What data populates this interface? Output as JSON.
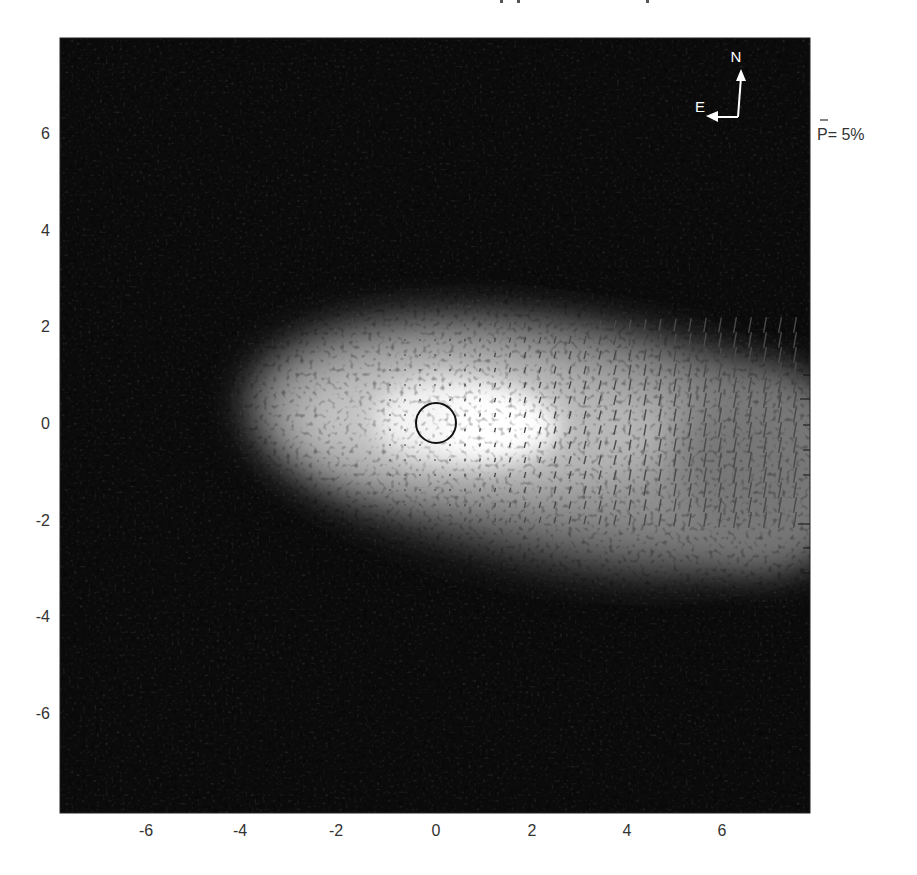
{
  "figure": {
    "title_visible": false,
    "compass": {
      "north_label": "N",
      "east_label": "E"
    },
    "legend": {
      "label": "P= 5%",
      "symbol": "P-bar (mean polarization) reference"
    },
    "colors": {
      "background": "#ffffff",
      "image_min": "#0a0a0a",
      "image_max": "#ffffff",
      "vector": "#555555",
      "circle": "#111111",
      "text": "#333333"
    }
  },
  "chart_data": {
    "type": "heatmap",
    "title": "",
    "xlabel": "",
    "ylabel": "",
    "xlim": [
      -7.8,
      7.8
    ],
    "ylim": [
      -7.8,
      7.8
    ],
    "x_ticks": [
      -6,
      -4,
      -2,
      0,
      2,
      4,
      6
    ],
    "y_ticks": [
      6,
      4,
      2,
      0,
      -2,
      -4,
      -6
    ],
    "x_tick_labels": [
      "-6",
      "-4",
      "-2",
      "0",
      "2",
      "4",
      "6"
    ],
    "y_tick_labels": [
      "6",
      "4",
      "2",
      "0",
      "-2",
      "-4",
      "-6"
    ],
    "grid": false,
    "colormap": "grayscale",
    "features": {
      "central_source_circle": {
        "x": 0,
        "y": 0,
        "radius": 0.4
      },
      "bright_emission": "Elongated bright nebula centered near (0.5, 0), extending toward +x (east-west axis), widening and sloping slightly downward to the right",
      "polarization_vectors": {
        "orientation": "near-vertical, slightly tilted (~10-15 deg)",
        "extent_x": [
          -1,
          7.8
        ],
        "extent_y": [
          -2.3,
          2.2
        ],
        "trend": "vector length increases with x; near zero west of x=0"
      }
    },
    "annotations": [
      "N",
      "E",
      "P= 5%"
    ],
    "legend_position": "right, top"
  }
}
